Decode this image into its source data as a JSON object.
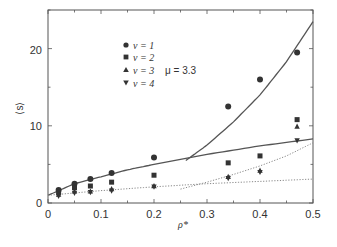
{
  "chart_data": {
    "type": "scatter",
    "title": "",
    "xlabel": "ρ*",
    "ylabel": "⟨s⟩",
    "xlim": [
      0,
      0.5
    ],
    "ylim": [
      0,
      25
    ],
    "xticks": [
      "0",
      "0.1",
      "0.2",
      "0.3",
      "0.4",
      "0.5"
    ],
    "yticks": [
      "0",
      "10",
      "20"
    ],
    "grid": false,
    "legend_position": "upper-left-inside",
    "annotation": "μ=3.3",
    "series": [
      {
        "name": "ν=1",
        "marker": "circle",
        "x": [
          0.02,
          0.05,
          0.08,
          0.12,
          0.2,
          0.34,
          0.4,
          0.47
        ],
        "y": [
          1.7,
          2.5,
          3.1,
          3.9,
          5.9,
          12.5,
          16.0,
          19.5
        ]
      },
      {
        "name": "ν=2",
        "marker": "square",
        "x": [
          0.02,
          0.05,
          0.08,
          0.12,
          0.2,
          0.34,
          0.4,
          0.47
        ],
        "y": [
          1.4,
          2.0,
          2.2,
          2.7,
          3.6,
          5.2,
          6.1,
          10.8
        ]
      },
      {
        "name": "ν=3",
        "marker": "triangle-up",
        "x": [
          0.02,
          0.05,
          0.08,
          0.12,
          0.2,
          0.34,
          0.4,
          0.47
        ],
        "y": [
          1.1,
          1.5,
          1.5,
          1.8,
          2.2,
          3.4,
          4.2,
          9.9
        ]
      },
      {
        "name": "ν=4",
        "marker": "triangle-down",
        "x": [
          0.02,
          0.05,
          0.08,
          0.12,
          0.2,
          0.34,
          0.4,
          0.47
        ],
        "y": [
          0.9,
          1.3,
          1.4,
          1.6,
          2.1,
          3.2,
          4.0,
          8.1
        ]
      }
    ],
    "curves": [
      {
        "name": "fit-solid-low",
        "style": "solid",
        "x": [
          0,
          0.05,
          0.1,
          0.15,
          0.2,
          0.3,
          0.4,
          0.5
        ],
        "y": [
          1.0,
          2.5,
          3.4,
          4.3,
          5.0,
          6.3,
          7.4,
          8.3
        ]
      },
      {
        "name": "fit-solid-high",
        "style": "solid",
        "x": [
          0.26,
          0.3,
          0.35,
          0.4,
          0.45,
          0.5
        ],
        "y": [
          5.5,
          7.5,
          10.5,
          14.0,
          18.3,
          23.5
        ]
      },
      {
        "name": "fit-dotted-low",
        "style": "dotted",
        "x": [
          0,
          0.1,
          0.2,
          0.3,
          0.4,
          0.5
        ],
        "y": [
          1.0,
          1.6,
          2.1,
          2.5,
          2.8,
          3.1
        ]
      },
      {
        "name": "fit-dotted-high",
        "style": "dotted",
        "x": [
          0.25,
          0.3,
          0.35,
          0.4,
          0.45,
          0.5
        ],
        "y": [
          1.8,
          2.7,
          3.7,
          4.8,
          6.1,
          7.8
        ]
      }
    ]
  },
  "legend": {
    "items": [
      {
        "label": "ν = 1"
      },
      {
        "label": "ν = 2"
      },
      {
        "label": "ν = 3"
      },
      {
        "label": "ν = 4"
      }
    ]
  },
  "annotation": "μ = 3.3",
  "axes": {
    "xlabel": "ρ*",
    "ylabel": "⟨s⟩",
    "xtick_labels": [
      "0",
      "0.1",
      "0.2",
      "0.3",
      "0.4",
      "0.5"
    ],
    "ytick_labels": [
      "0",
      "10",
      "20"
    ]
  },
  "colors": {
    "ink": "#333333",
    "curve": "#555555",
    "dotted": "#888888"
  }
}
